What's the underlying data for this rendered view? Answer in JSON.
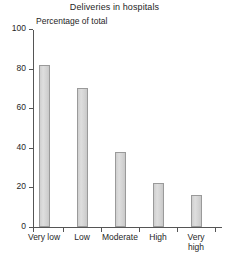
{
  "chart_data": {
    "type": "bar",
    "title": "Deliveries in hospitals",
    "xlabel": "",
    "ylabel": "Percentage of total",
    "categories": [
      "Very low",
      "Low",
      "Moderate",
      "High",
      "Very\nhigh"
    ],
    "values": [
      82,
      70,
      38,
      22,
      16
    ],
    "ylim": [
      0,
      100
    ],
    "yticks": [
      0,
      20,
      40,
      60,
      80,
      100
    ],
    "ytick_labels": [
      "0",
      "20",
      "40",
      "60",
      "80",
      "100"
    ],
    "grid": false,
    "legend": "none",
    "bar_fill_color": "#d8d8d8",
    "bar_border_color": "#9a9a9a",
    "axis_color": "#555555",
    "background_color": "#ffffff"
  }
}
